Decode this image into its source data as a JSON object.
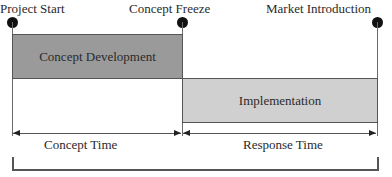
{
  "milestones": [
    {
      "label": "Project Start"
    },
    {
      "label": "Concept Freeze"
    },
    {
      "label": "Market Introduction"
    }
  ],
  "phases": [
    {
      "label": "Concept Development",
      "color": "#9a9a9a"
    },
    {
      "label": "Implementation",
      "color": "#d0d0d0"
    }
  ],
  "durations": [
    {
      "label": "Concept Time"
    },
    {
      "label": "Response Time"
    }
  ]
}
